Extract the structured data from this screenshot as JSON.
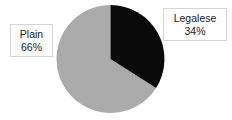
{
  "chart_data": {
    "type": "pie",
    "title": "",
    "subtitle": "",
    "xlabel": "",
    "ylabel": "",
    "categories": [
      "Legalese",
      "Plain"
    ],
    "values": [
      34,
      66
    ],
    "unit": "%",
    "series": [
      {
        "name": "Share",
        "values": [
          34,
          66
        ]
      }
    ],
    "slices": [
      {
        "label": "Legalese",
        "value": 34,
        "value_text": "34%",
        "color": "#0a0a0a",
        "start_angle_deg": 0,
        "end_angle_deg": 122.4
      },
      {
        "label": "Plain",
        "value": 66,
        "value_text": "66%",
        "color": "#ababab",
        "start_angle_deg": 122.4,
        "end_angle_deg": 360
      }
    ],
    "legend": "none",
    "grid": false,
    "labels_position": "outside-boxed",
    "start_angle_deg": 0,
    "direction": "clockwise"
  },
  "labels": {
    "plain": {
      "name": "Plain",
      "value": "66%"
    },
    "legalese": {
      "name": "Legalese",
      "value": "34%"
    }
  },
  "colors": {
    "background": "#ffffff",
    "slice_legalese": "#0a0a0a",
    "slice_plain": "#ababab",
    "label_border": "#d4d4d4",
    "label_text": "#1a1a1a"
  }
}
